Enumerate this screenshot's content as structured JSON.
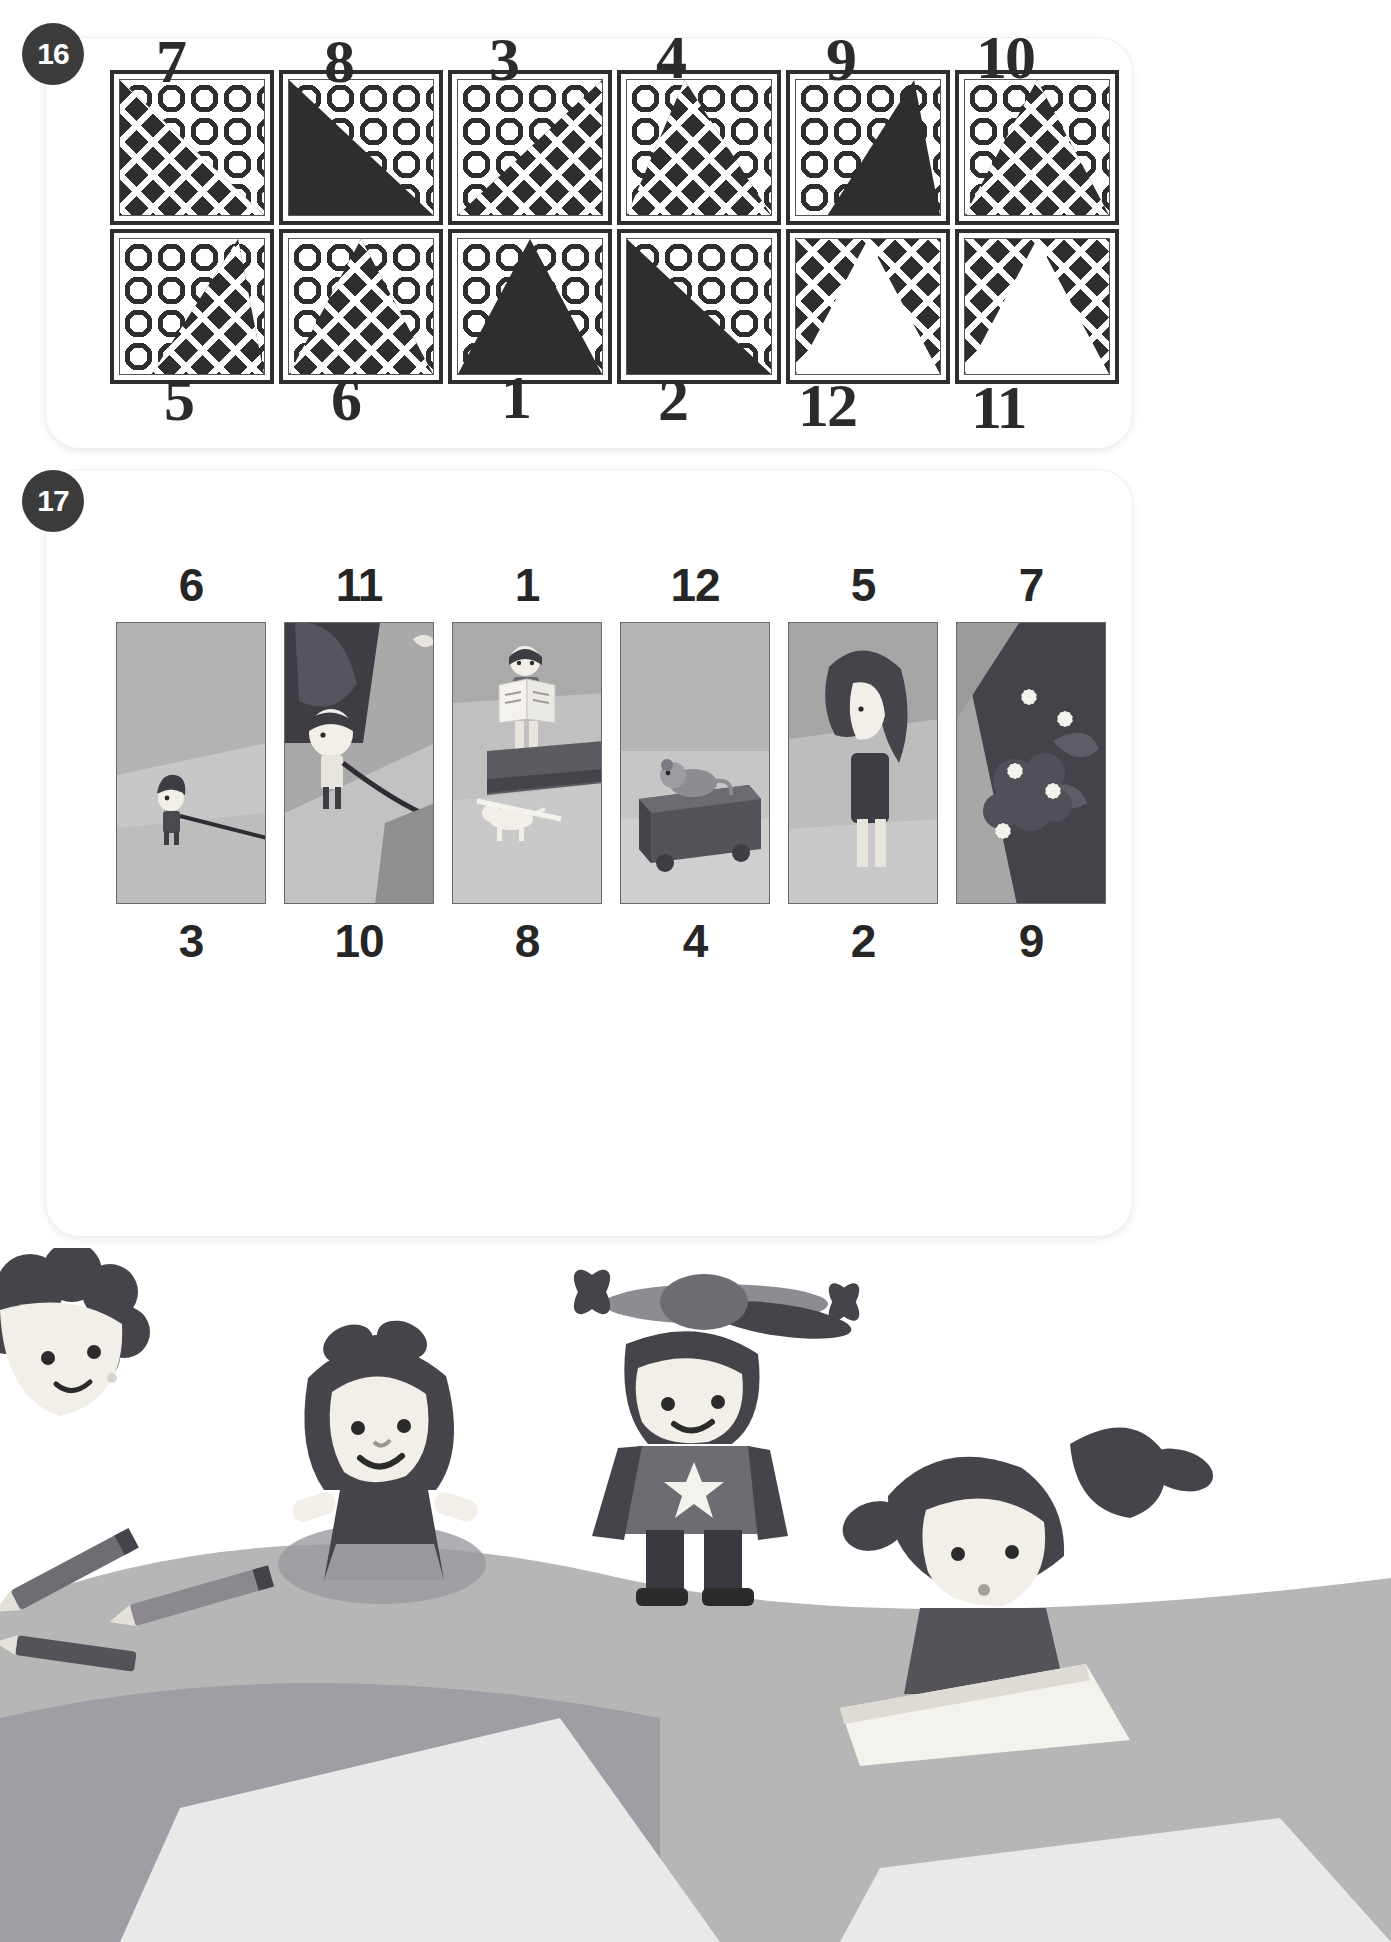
{
  "page": {
    "background": "#ffffff",
    "ink": "#2b2b2b",
    "badge_bg": "#3b3b3b"
  },
  "exercise16": {
    "number": "16",
    "row1_labels": [
      "7",
      "8",
      "3",
      "4",
      "9",
      "10"
    ],
    "row2_labels": [
      "5",
      "6",
      "1",
      "2",
      "12",
      "11"
    ],
    "tiles": [
      {
        "id": "t1",
        "bg": "circles",
        "shape": "diamonds",
        "form": "tri-left",
        "answer": "7"
      },
      {
        "id": "t2",
        "bg": "circles",
        "shape": "solid",
        "form": "tri-left",
        "answer": "8"
      },
      {
        "id": "t3",
        "bg": "circles",
        "shape": "diamonds",
        "form": "tri-right",
        "answer": "3"
      },
      {
        "id": "t4",
        "bg": "circles",
        "shape": "diamonds",
        "form": "tri-wide",
        "answer": "4"
      },
      {
        "id": "t5",
        "bg": "circles",
        "shape": "solid",
        "form": "tri-lean-r",
        "answer": "9"
      },
      {
        "id": "t6",
        "bg": "circles",
        "shape": "diamonds",
        "form": "tri-center",
        "answer": "10"
      },
      {
        "id": "t7",
        "bg": "circles",
        "shape": "diamonds",
        "form": "tri-lean-r",
        "answer": "5"
      },
      {
        "id": "t8",
        "bg": "circles",
        "shape": "diamonds",
        "form": "tri-center",
        "answer": "6"
      },
      {
        "id": "t9",
        "bg": "circles",
        "shape": "solid",
        "form": "tri-center",
        "answer": "1"
      },
      {
        "id": "t10",
        "bg": "circles",
        "shape": "solid",
        "form": "tri-left",
        "answer": "2"
      },
      {
        "id": "t11",
        "bg": "diamonds",
        "shape": "white",
        "form": "tri-center",
        "answer": "12"
      },
      {
        "id": "t12",
        "bg": "diamonds",
        "shape": "white",
        "form": "tri-center",
        "answer": "11"
      }
    ]
  },
  "exercise17": {
    "number": "17",
    "top_labels": [
      "6",
      "11",
      "1",
      "12",
      "5",
      "7"
    ],
    "bottom_labels": [
      "3",
      "10",
      "8",
      "4",
      "2",
      "9"
    ],
    "top_cards": [
      {
        "id": "c1",
        "label": "6",
        "desc": "girl-with-leash-on-path"
      },
      {
        "id": "c2",
        "label": "11",
        "desc": "person-walking-dog-close-up"
      },
      {
        "id": "c3",
        "label": "1",
        "desc": "boy-reading-book-on-bench-with-dog"
      },
      {
        "id": "c4",
        "label": "12",
        "desc": "dog-sleeping-on-box"
      },
      {
        "id": "c5",
        "label": "5",
        "desc": "woman-with-long-hair"
      },
      {
        "id": "c6",
        "label": "7",
        "desc": "flower-bush-with-blossoms"
      }
    ],
    "bottom_cards": [
      {
        "id": "c7",
        "label": "3",
        "desc": "dog-running-on-leash"
      },
      {
        "id": "c8",
        "label": "10",
        "desc": "child-face-close-up"
      },
      {
        "id": "c9",
        "label": "8",
        "desc": "dark-flower-bed"
      },
      {
        "id": "c10",
        "label": "4",
        "desc": "man-with-glasses-walking-with-cane"
      },
      {
        "id": "c11",
        "label": "2",
        "desc": "boy-and-small-dog-in-park"
      },
      {
        "id": "c12",
        "label": "9",
        "desc": "dog-on-sofa"
      }
    ]
  },
  "decoration": {
    "items": [
      {
        "name": "curly-haired-boy",
        "desc": "boy with curly dark hair at left edge"
      },
      {
        "name": "girl-with-bow",
        "desc": "smiling girl with hair bow and dress"
      },
      {
        "name": "boy-with-propeller-hat",
        "desc": "boy wearing beanie with propeller and star shirt"
      },
      {
        "name": "girl-with-pigtails",
        "desc": "girl with pigtails reading a book"
      },
      {
        "name": "pencils",
        "desc": "scattered pencils"
      },
      {
        "name": "paper-sheet",
        "desc": "white paper sheet"
      }
    ]
  },
  "palette": {
    "ink": "#2e2e2e",
    "dark": "#454349",
    "mid_gray": "#9a9a9a",
    "light_gray": "#c9c9c9",
    "pale_gray": "#dcdcdc",
    "accent_gray": "#7f7f85"
  }
}
